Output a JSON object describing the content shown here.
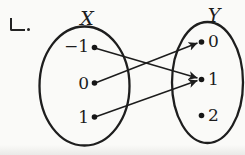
{
  "item_label": "ㄴ.",
  "diagram": {
    "kind": "function-mapping",
    "sets": {
      "x": {
        "name": "X",
        "elements": [
          "−1",
          "0",
          "1"
        ]
      },
      "y": {
        "name": "Y",
        "elements": [
          "0",
          "1",
          "2"
        ]
      }
    },
    "mappings": [
      {
        "from": "−1",
        "to": "1"
      },
      {
        "from": "0",
        "to": "0"
      },
      {
        "from": "1",
        "to": "1"
      }
    ],
    "unmapped_codomain_elements": [
      "2"
    ],
    "colors": {
      "ink": "#1c1c1c",
      "paper": "#fafaf8"
    }
  }
}
